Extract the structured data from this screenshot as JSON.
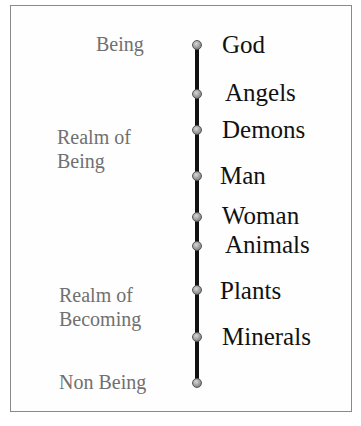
{
  "diagram": {
    "type": "hierarchy-scale",
    "realms": [
      {
        "label": "Being",
        "lines": [
          "Being"
        ]
      },
      {
        "label": "Realm of Being",
        "lines": [
          "Realm of",
          "Being"
        ]
      },
      {
        "label": "Realm of Becoming",
        "lines": [
          "Realm of",
          "Becoming"
        ]
      },
      {
        "label": "Non Being",
        "lines": [
          "Non Being"
        ]
      }
    ],
    "items": [
      "God",
      "Angels",
      "Demons",
      "Man",
      "Woman",
      "Animals",
      "Plants",
      "Minerals"
    ],
    "colors": {
      "axis": "#111111",
      "node": "#9a9a9a",
      "realm_text": "#707070",
      "item_text": "#111111",
      "frame": "#8a8a8a"
    }
  }
}
